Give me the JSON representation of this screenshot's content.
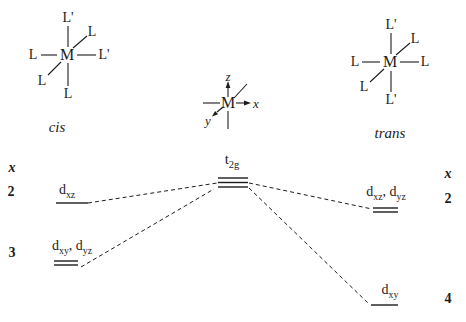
{
  "colors": {
    "ink": "#1c1c1c",
    "background": "#ffffff"
  },
  "structures": {
    "cis": {
      "metal": "M",
      "label": "cis",
      "ligands": {
        "top": "L'",
        "top_right": "L",
        "left": "L",
        "right": "L'",
        "bottom_left": "L",
        "bottom": "L"
      }
    },
    "trans": {
      "metal": "M",
      "label": "trans",
      "ligands": {
        "top": "L'",
        "top_right": "L",
        "left": "L",
        "right": "L",
        "bottom_left": "L",
        "bottom": "L'"
      }
    }
  },
  "axes": {
    "metal": "M",
    "x_label": "x",
    "y_label": "y",
    "z_label": "z"
  },
  "energy": {
    "t2g": {
      "base": "t",
      "sub": "2g"
    },
    "left": {
      "header": "x",
      "upper": {
        "count": "2",
        "o1": "d",
        "o1sub": "xz"
      },
      "lower": {
        "count": "3",
        "o1": "d",
        "o1sub": "xy",
        "o2": ", d",
        "o2sub": "yz"
      }
    },
    "right": {
      "header": "x",
      "upper": {
        "count": "2",
        "o1": "d",
        "o1sub": "xz",
        "o2": ", d",
        "o2sub": "yz"
      },
      "lower": {
        "count": "4",
        "o1": "d",
        "o1sub": "xy"
      }
    }
  }
}
